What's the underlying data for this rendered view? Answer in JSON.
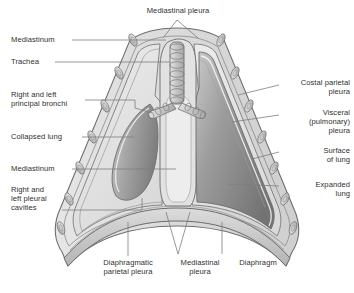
{
  "figure": {
    "colors": {
      "outline": "#6f6f6f",
      "body_wall_fill": "#d9d9d9",
      "pleural_cavity_fill": "#e8e8e8",
      "collapsed_lung_dark": "#8b8b8b",
      "collapsed_lung_light": "#c6c6c6",
      "expanded_lung_dark": "#7d7d7d",
      "expanded_lung_light": "#c2c2c2",
      "mediastinum_fill": "#dedede",
      "rib_fill": "#cfcfcf",
      "trachea_fill": "#cdcdcd",
      "leader_line": "#7a7a7a",
      "text": "#2f2f2f"
    }
  },
  "labels": {
    "mediastinal_pleura_top": "Mediastinal pleura",
    "mediastinum_upper": "Mediastinum",
    "trachea": "Trachea",
    "principal_bronchi": "Right and left\nprincipal bronchi",
    "collapsed_lung": "Collapsed lung",
    "mediastinum_lower": "Mediastinum",
    "pleural_cavities": "Right and\nleft pleural\ncavities",
    "costal_parietal_pleura": "Costal parietal\npleura",
    "visceral_pleura": "Visceral\n(pulmonary)\npleura",
    "surface_of_lung": "Surface\nof lung",
    "expanded_lung": "Expanded\nlung",
    "diaphragmatic_parietal_pleura": "Diaphragmatic\nparietal pleura",
    "mediastinal_pleura_bottom": "Mediastinal\npleura",
    "diaphragm": "Diaphragm"
  }
}
